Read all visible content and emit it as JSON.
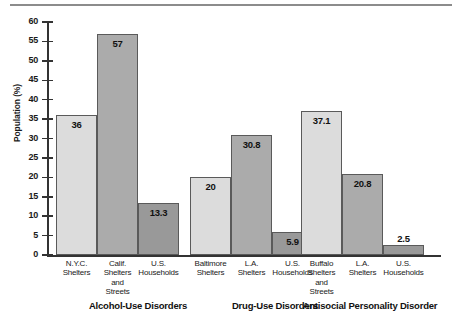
{
  "chart_data": {
    "type": "bar",
    "title": "",
    "xlabel": "",
    "ylabel": "Population (%)",
    "ylim": [
      0,
      60
    ],
    "yticks": [
      0,
      5,
      10,
      15,
      20,
      25,
      30,
      35,
      40,
      45,
      50,
      55,
      60
    ],
    "grid": false,
    "legend": "none",
    "groups": [
      {
        "name": "Alcohol-Use Disorders",
        "categories": [
          "N.Y.C. Shelters",
          "Calif. Shelters and Streets",
          "U.S. Households"
        ],
        "values": [
          36,
          57,
          13.3
        ],
        "value_labels": [
          "36",
          "57",
          "13.3"
        ],
        "colors": [
          "#dcdcdc",
          "#ababab",
          "#999999"
        ]
      },
      {
        "name": "Drug-Use Disorders",
        "categories": [
          "Baltimore Shelters",
          "L.A. Shelters",
          "U.S. Households"
        ],
        "values": [
          20,
          30.8,
          5.9
        ],
        "value_labels": [
          "20",
          "30.8",
          "5.9"
        ],
        "colors": [
          "#dcdcdc",
          "#ababab",
          "#999999"
        ]
      },
      {
        "name": "Antisocial Personality Disorder",
        "categories": [
          "Buffalo Shelters and Streets",
          "L.A. Shelters",
          "U.S. Households"
        ],
        "values": [
          37.1,
          20.8,
          2.5
        ],
        "value_labels": [
          "37.1",
          "20.8",
          "2.5"
        ],
        "colors": [
          "#dcdcdc",
          "#ababab",
          "#999999"
        ]
      }
    ],
    "category_label_lines": [
      [
        "N.Y.C.",
        "Shelters"
      ],
      [
        "Calif.",
        "Shelters",
        "and",
        "Streets"
      ],
      [
        "U.S.",
        "Households"
      ],
      [
        "Baltimore",
        "Shelters"
      ],
      [
        "L.A.",
        "Shelters"
      ],
      [
        "U.S.",
        "Households"
      ],
      [
        "Buffalo",
        "Shelters",
        "and",
        "Streets"
      ],
      [
        "L.A.",
        "Shelters"
      ],
      [
        "U.S.",
        "Households"
      ]
    ]
  },
  "axis": {
    "tick_labels": [
      "60",
      "55",
      "50",
      "45",
      "40",
      "35",
      "30",
      "25",
      "20",
      "15",
      "10",
      "5",
      "0"
    ],
    "y_title": "Population (%)"
  },
  "group_titles": {
    "g0": "Alcohol-Use Disorders",
    "g1": "Drug-Use Disorders",
    "g2": "Antisocial Personality Disorder"
  },
  "colors": {
    "bar_light": "#dcdcdc",
    "bar_medium": "#ababab",
    "bar_dark": "#999999",
    "axis": "#333333",
    "rule": "#8c8c8c",
    "text": "#1a1a1a"
  }
}
